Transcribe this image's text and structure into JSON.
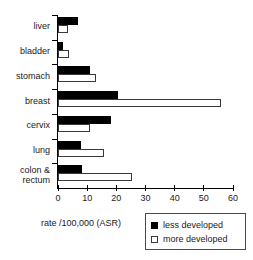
{
  "chart_data": {
    "type": "bar",
    "orientation": "horizontal",
    "title": "",
    "xlabel": "rate /100,000 (ASR)",
    "ylabel": "",
    "xlim": [
      0,
      60
    ],
    "xticks": [
      0,
      10,
      20,
      30,
      40,
      50,
      60
    ],
    "xticklabels": [
      "0",
      "10",
      "20",
      "30",
      "40",
      "50",
      "60"
    ],
    "grid": false,
    "categories": [
      "liver",
      "bladder",
      "stomach",
      "breast",
      "cervix",
      "lung",
      "colon & rectum"
    ],
    "category_labels": [
      [
        "liver"
      ],
      [
        "bladder"
      ],
      [
        "stomach"
      ],
      [
        "breast"
      ],
      [
        "cervix"
      ],
      [
        "lung"
      ],
      [
        "colon &",
        "rectum"
      ]
    ],
    "series": [
      {
        "name": "less developed",
        "color": "#000000",
        "values": [
          7.0,
          1.7,
          11.0,
          20.5,
          18.0,
          8.0,
          8.2
        ]
      },
      {
        "name": "more developed",
        "color": "#ffffff",
        "values": [
          3.4,
          3.8,
          13.0,
          56.0,
          11.0,
          15.6,
          25.5
        ]
      }
    ],
    "legend": {
      "position": "bottom-right",
      "entries": [
        {
          "label": "less developed",
          "swatch": "filled-black-square"
        },
        {
          "label": "more developed",
          "swatch": "open-white-square"
        }
      ]
    }
  }
}
